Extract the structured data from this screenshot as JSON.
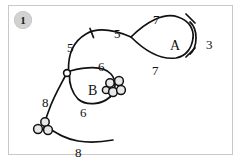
{
  "figure": {
    "badge_number": "1",
    "background_color": "#ffffff",
    "stroke_color": "#111111",
    "frame_color": "#c9c9c9",
    "badge_color": "#d2d2d2"
  },
  "regions": [
    {
      "id": "region-a",
      "label": "A",
      "x": 170,
      "y": 39
    },
    {
      "id": "region-b",
      "label": "B",
      "x": 88,
      "y": 84
    }
  ],
  "edge_labels": [
    {
      "id": "label-a-top",
      "text": "7",
      "x": 153,
      "y": 13
    },
    {
      "id": "label-a-right",
      "text": "3",
      "x": 206,
      "y": 38
    },
    {
      "id": "label-a-bottom",
      "text": "7",
      "x": 152,
      "y": 64
    },
    {
      "id": "label-spine-right",
      "text": "5",
      "x": 114,
      "y": 27
    },
    {
      "id": "label-spine-left",
      "text": "5",
      "x": 67,
      "y": 41
    },
    {
      "id": "label-b-top",
      "text": "6",
      "x": 98,
      "y": 60
    },
    {
      "id": "label-b-bottom",
      "text": "6",
      "x": 80,
      "y": 106
    },
    {
      "id": "label-tail-left",
      "text": "8",
      "x": 42,
      "y": 96
    },
    {
      "id": "label-tail-bottom",
      "text": "8",
      "x": 75,
      "y": 146
    }
  ],
  "nodes": [
    {
      "id": "node-b-junction",
      "type": "open-circle",
      "cx": 67,
      "cy": 73,
      "r": 3.4
    },
    {
      "id": "node-a-cusp",
      "type": "cusp",
      "cx": 131,
      "cy": 37
    }
  ],
  "circle_clusters": [
    {
      "id": "cluster-right",
      "count": 5,
      "circles": [
        {
          "cx": 110,
          "cy": 84,
          "r": 4.2
        },
        {
          "cx": 118,
          "cy": 82,
          "r": 4.4
        },
        {
          "cx": 112,
          "cy": 92,
          "r": 4.4
        },
        {
          "cx": 120,
          "cy": 90,
          "r": 4.4
        },
        {
          "cx": 106,
          "cy": 90,
          "r": 3.6
        }
      ]
    },
    {
      "id": "cluster-bottom-left",
      "count": 3,
      "circles": [
        {
          "cx": 44,
          "cy": 123,
          "r": 4.2
        },
        {
          "cx": 38,
          "cy": 130,
          "r": 4.4
        },
        {
          "cx": 48,
          "cy": 130,
          "r": 4.4
        }
      ]
    }
  ],
  "ticks": [
    {
      "id": "tick-spine",
      "x1": 90,
      "y1": 29,
      "x2": 93,
      "y2": 37
    },
    {
      "id": "tick-a-upper",
      "x1": 186,
      "y1": 14,
      "x2": 176,
      "y2": 23
    },
    {
      "id": "tick-a-lower",
      "x1": 186,
      "y1": 57,
      "x2": 176,
      "y2": 49
    }
  ]
}
